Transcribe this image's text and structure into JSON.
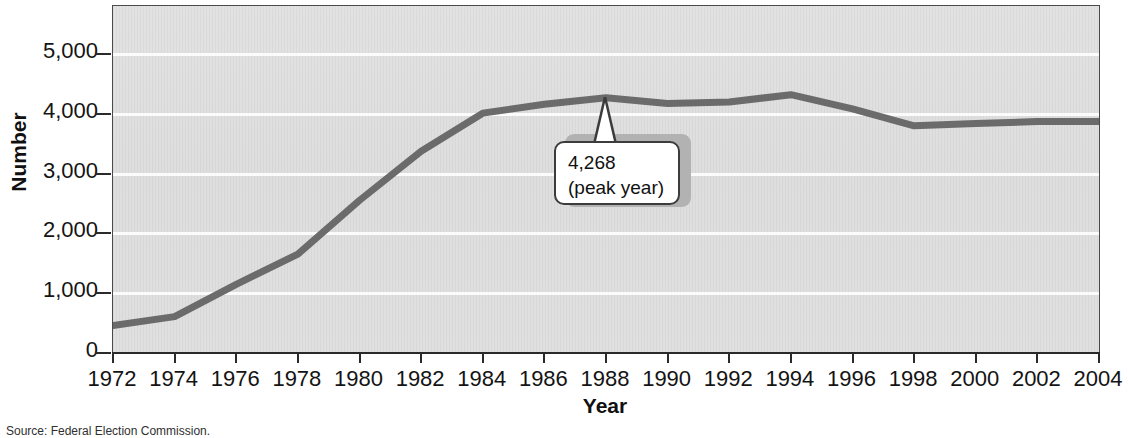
{
  "chart_data": {
    "type": "line",
    "title": "",
    "subtitle": "",
    "xlabel": "Year",
    "ylabel": "Number",
    "x": [
      1972,
      1974,
      1976,
      1978,
      1980,
      1982,
      1984,
      1986,
      1988,
      1990,
      1992,
      1994,
      1996,
      1998,
      2000,
      2002,
      2004
    ],
    "categories": [
      "1972",
      "1974",
      "1976",
      "1978",
      "1980",
      "1982",
      "1984",
      "1986",
      "1988",
      "1990",
      "1992",
      "1994",
      "1996",
      "1998",
      "2000",
      "2002",
      "2004"
    ],
    "values": [
      460,
      608,
      1146,
      1653,
      2551,
      3371,
      4009,
      4157,
      4268,
      4172,
      4195,
      4318,
      4079,
      3798,
      3835,
      3868,
      3868
    ],
    "series": [
      {
        "name": "Number of PACs",
        "values": [
          460,
          608,
          1146,
          1653,
          2551,
          3371,
          4009,
          4157,
          4268,
          4172,
          4195,
          4318,
          4079,
          3798,
          3835,
          3868,
          3868
        ],
        "color": "#6b6b6b"
      }
    ],
    "xlim": [
      1972,
      2004
    ],
    "ylim": [
      0,
      5800
    ],
    "xtick_step": 2,
    "yticks": [
      0,
      1000,
      2000,
      3000,
      4000,
      5000
    ],
    "ytick_labels": [
      "0",
      "1,000",
      "2,000",
      "3,000",
      "4,000",
      "5,000"
    ],
    "grid": "horizontal",
    "grid_color": "#fbfbfb",
    "plot_background": "#e0e0e0",
    "legend": "none",
    "annotations": [
      {
        "name": "peak-callout",
        "line1": "4,268",
        "line2": "(peak year)",
        "points_to_x": 1988,
        "points_to_y": 4268
      }
    ]
  },
  "figure": {
    "source_note": "Source: Federal Election Commission.",
    "axis_color": "#2a2a2a",
    "text_color": "#141414"
  }
}
